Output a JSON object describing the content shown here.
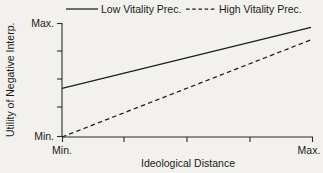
{
  "chart_data": {
    "type": "line",
    "title": "",
    "xlabel": "Ideological Distance",
    "ylabel": "Utility of Negative Interp.",
    "xlim": [
      0,
      1
    ],
    "ylim": [
      0,
      1
    ],
    "x_tick_labels": [
      "Min.",
      "Max."
    ],
    "y_tick_labels": [
      "Min.",
      "Max."
    ],
    "x_minor_tick_count": 3,
    "y_minor_tick_count": 3,
    "grid": false,
    "legend_position": "top",
    "line_color": "#1d1d1d",
    "background_color": "#f2f1ee",
    "series": [
      {
        "name": "Low Vitality Prec.",
        "style": "solid",
        "x": [
          0,
          1
        ],
        "values": [
          0.43,
          0.97
        ]
      },
      {
        "name": "High Vitality Prec.",
        "style": "dashed",
        "x": [
          0,
          1
        ],
        "values": [
          0.0,
          0.86
        ]
      }
    ]
  },
  "axes": {
    "y": {
      "title": "Utility of Negative Interp.",
      "max_label": "Max.",
      "min_label": "Min."
    },
    "x": {
      "title": "Ideological Distance",
      "min_label": "Min.",
      "max_label": "Max."
    }
  },
  "legend": {
    "entries": [
      {
        "label": "Low Vitality Prec.",
        "style": "solid"
      },
      {
        "label": "High Vitality Prec.",
        "style": "dashed"
      }
    ]
  }
}
